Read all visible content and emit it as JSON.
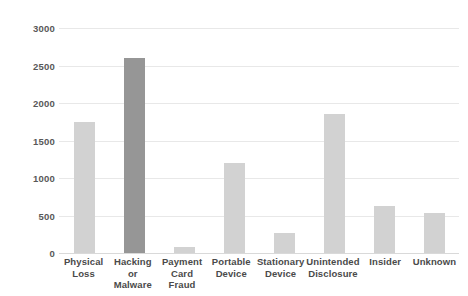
{
  "chart_data": {
    "type": "bar",
    "title": "",
    "subtitle": "",
    "xlabel": "",
    "ylabel": "",
    "categories": [
      "Physical Loss",
      "Hacking or Malware",
      "Payment Card Fraud",
      "Portable Device",
      "Stationary Device",
      "Unintended Disclosure",
      "Insider",
      "Unknown"
    ],
    "category_lines": [
      [
        "Physical",
        "Loss"
      ],
      [
        "Hacking or",
        "Malware"
      ],
      [
        "Payment",
        "Card Fraud"
      ],
      [
        "Portable",
        "Device"
      ],
      [
        "Stationary",
        "Device"
      ],
      [
        "Unintended",
        "Disclosure"
      ],
      [
        "Insider"
      ],
      [
        "Unknown"
      ]
    ],
    "values": [
      1750,
      2600,
      80,
      1200,
      270,
      1850,
      630,
      530
    ],
    "ylim": [
      0,
      3000
    ],
    "yticks": [
      0,
      500,
      1000,
      1500,
      2000,
      2500,
      3000
    ],
    "ytick_labels": [
      "0",
      "500",
      "1000",
      "1500",
      "2000",
      "2500",
      "3000"
    ],
    "grid": true,
    "legend": false,
    "bar_color": "#d2d2d2",
    "highlight_color": "#969696",
    "highlight_index": 1,
    "gridline_color": "#e8e8e8",
    "label_color": "#4a4a4a",
    "background": "#ffffff"
  }
}
